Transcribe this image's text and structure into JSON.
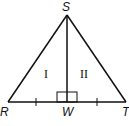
{
  "diagram": {
    "type": "geometry-triangle",
    "vertices": {
      "S": {
        "label": "S"
      },
      "R": {
        "label": "R"
      },
      "T": {
        "label": "T"
      },
      "W": {
        "label": "W"
      }
    },
    "regions": {
      "left": "I",
      "right": "II"
    },
    "notes": {
      "segment_SW": "altitude, perpendicular to RT (right-angle mark at W)",
      "tick_marks": "RW and WT each have one tick mark (congruent)"
    },
    "colors": {
      "stroke": "#111111",
      "background": "#ffffff"
    }
  }
}
